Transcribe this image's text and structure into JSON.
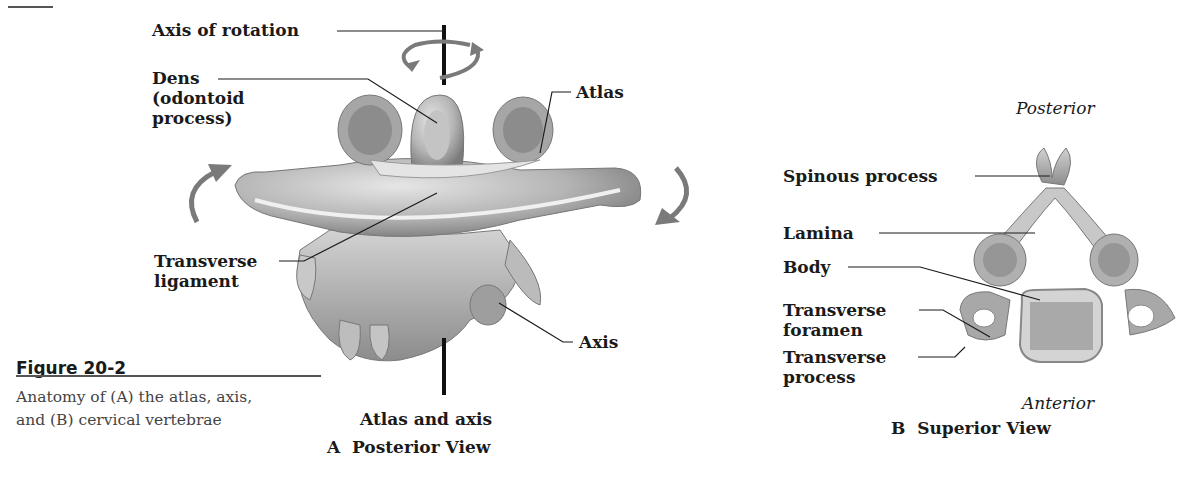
{
  "figure": {
    "number": "Figure 20-2",
    "caption": "Anatomy of (A) the atlas, axis, and (B) cervical vertebrae"
  },
  "panel_a": {
    "title_line1": "Atlas and axis",
    "title_line2": "A  Posterior View",
    "labels": {
      "axis_of_rotation": "Axis of rotation",
      "dens_line1": "Dens",
      "dens_line2": "(odontoid",
      "dens_line3": "process)",
      "atlas": "Atlas",
      "transverse_ligament_line1": "Transverse",
      "transverse_ligament_line2": "ligament",
      "axis": "Axis"
    }
  },
  "panel_b": {
    "title": "B  Superior View",
    "orientation_top": "Posterior",
    "orientation_bottom": "Anterior",
    "labels": {
      "spinous_process": "Spinous process",
      "lamina": "Lamina",
      "body": "Body",
      "transverse_foramen_line1": "Transverse",
      "transverse_foramen_line2": "foramen",
      "transverse_process_line1": "Transverse",
      "transverse_process_line2": "process"
    }
  },
  "colors": {
    "bone_light": "#d8d8d8",
    "bone_mid": "#a8a8a8",
    "bone_dark": "#6e6e6e",
    "arrow": "#7a7a7a",
    "text": "#1a1a1a"
  }
}
